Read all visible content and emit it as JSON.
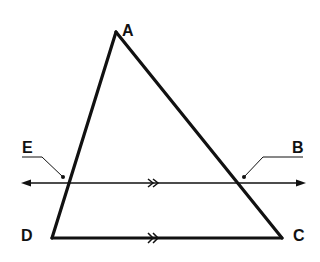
{
  "diagram": {
    "type": "geometry",
    "points": {
      "A": {
        "label": "A",
        "x": 116,
        "y": 32
      },
      "D": {
        "label": "D",
        "x": 52,
        "y": 238
      },
      "C": {
        "label": "C",
        "x": 282,
        "y": 238
      },
      "E": {
        "label": "E",
        "x": 67,
        "y": 183
      },
      "B": {
        "label": "B",
        "x": 240,
        "y": 183
      }
    },
    "segments": [
      {
        "from": "A",
        "to": "D"
      },
      {
        "from": "A",
        "to": "C"
      },
      {
        "from": "D",
        "to": "C",
        "parallel_mark": "double-chevron"
      }
    ],
    "lines": [
      {
        "through": [
          "E",
          "B"
        ],
        "arrows": "both",
        "parallel_mark": "double-chevron"
      }
    ],
    "parallel": [
      [
        "EB",
        "DC"
      ]
    ]
  },
  "labels": {
    "A": "A",
    "B": "B",
    "C": "C",
    "D": "D",
    "E": "E"
  },
  "colors": {
    "stroke": "#111111",
    "background": "#ffffff"
  }
}
